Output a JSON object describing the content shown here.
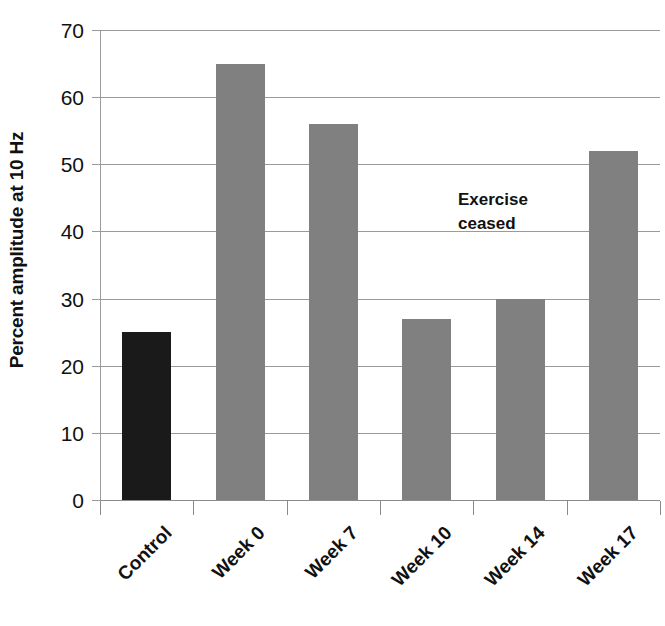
{
  "chart_data": {
    "type": "bar",
    "title": "",
    "subtitle": "",
    "xlabel": "",
    "ylabel": "Percent amplitude at 10 Hz",
    "categories": [
      "Control",
      "Week 0",
      "Week 7",
      "Week 10",
      "Week 14",
      "Week 17"
    ],
    "values": [
      25,
      65,
      56,
      27,
      30,
      52
    ],
    "bar_colors": [
      "#1a1a1a",
      "#808080",
      "#808080",
      "#808080",
      "#808080",
      "#808080"
    ],
    "ylim": [
      0,
      70
    ],
    "ytick_step": 10,
    "ytick_labels": [
      "0",
      "10",
      "20",
      "30",
      "40",
      "50",
      "60",
      "70"
    ],
    "ytick_values": [
      0,
      10,
      20,
      30,
      40,
      50,
      60,
      70
    ],
    "grid": true,
    "grid_axis": "y",
    "legend": false,
    "legend_position": "none",
    "annotations": [
      {
        "text": "Exercise\nceased",
        "x_category": "Week 14",
        "y_value": 45,
        "bold": true
      }
    ],
    "colors": {
      "control_bar": "#1a1a1a",
      "treatment_bar": "#808080",
      "gridline": "#9a9a9a",
      "axis": "#8a8a8a",
      "text": "#111111",
      "background": "#ffffff"
    }
  }
}
